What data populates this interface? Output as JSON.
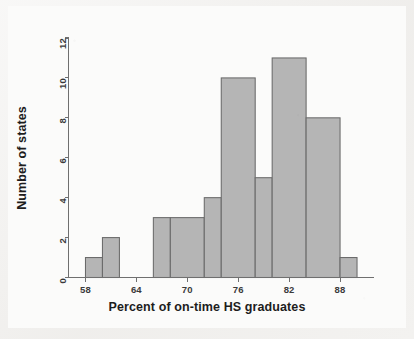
{
  "chart_data": {
    "type": "bar",
    "chart_kind": "histogram",
    "title": "",
    "subtitle": "",
    "xlabel": "Percent of on-time HS graduates",
    "ylabel": "Number of states",
    "xlim": [
      56,
      92
    ],
    "ylim": [
      0,
      12
    ],
    "xticks": [
      58,
      64,
      70,
      76,
      82,
      88
    ],
    "yticks": [
      0,
      2,
      4,
      6,
      8,
      10,
      12
    ],
    "xtick_labels": [
      "58",
      "64",
      "70",
      "76",
      "82",
      "88"
    ],
    "ytick_labels": [
      "0",
      "2",
      "4",
      "6",
      "8",
      "10",
      "12"
    ],
    "grid": false,
    "legend": false,
    "legend_position": "none",
    "bar_fill_color": "#b5b5b5",
    "bar_edge_color": "#6a6a6a",
    "axis_color": "#6f6f6f",
    "background_color": "#fbfbfa",
    "bins": [
      {
        "label": "58-60",
        "start": 58,
        "end": 60,
        "count": 1
      },
      {
        "label": "60-62",
        "start": 60,
        "end": 62,
        "count": 2
      },
      {
        "label": "62-64",
        "start": 62,
        "end": 64,
        "count": 0
      },
      {
        "label": "64-66",
        "start": 64,
        "end": 66,
        "count": 0
      },
      {
        "label": "66-68",
        "start": 66,
        "end": 68,
        "count": 3
      },
      {
        "label": "68-70",
        "start": 68,
        "end": 70,
        "count": 3
      },
      {
        "label": "70-72",
        "start": 70,
        "end": 72,
        "count": 3
      },
      {
        "label": "72-74",
        "start": 72,
        "end": 74,
        "count": 4
      },
      {
        "label": "74-76",
        "start": 74,
        "end": 76,
        "count": 10
      },
      {
        "label": "76-78",
        "start": 76,
        "end": 78,
        "count": 10
      },
      {
        "label": "78-80",
        "start": 78,
        "end": 80,
        "count": 5
      },
      {
        "label": "80-82",
        "start": 80,
        "end": 82,
        "count": 11
      },
      {
        "label": "82-84",
        "start": 82,
        "end": 84,
        "count": 11
      },
      {
        "label": "84-86",
        "start": 84,
        "end": 86,
        "count": 8
      },
      {
        "label": "86-88",
        "start": 86,
        "end": 88,
        "count": 8
      },
      {
        "label": "88-90",
        "start": 88,
        "end": 90,
        "count": 1
      }
    ],
    "bars": [
      {
        "start": 58,
        "end": 60,
        "value": 1
      },
      {
        "start": 60,
        "end": 62,
        "value": 2
      },
      {
        "start": 66,
        "end": 68,
        "value": 3
      },
      {
        "start": 68,
        "end": 72,
        "value": 3
      },
      {
        "start": 72,
        "end": 74,
        "value": 4
      },
      {
        "start": 74,
        "end": 78,
        "value": 10
      },
      {
        "start": 78,
        "end": 80,
        "value": 5
      },
      {
        "start": 80,
        "end": 84,
        "value": 11
      },
      {
        "start": 84,
        "end": 88,
        "value": 8
      },
      {
        "start": 88,
        "end": 90,
        "value": 1
      }
    ],
    "categories": [
      "58-60",
      "60-62",
      "66-68",
      "68-72",
      "72-74",
      "74-78",
      "78-80",
      "80-84",
      "84-88",
      "88-90"
    ],
    "values": [
      1,
      2,
      3,
      3,
      4,
      10,
      5,
      11,
      8,
      1
    ]
  }
}
